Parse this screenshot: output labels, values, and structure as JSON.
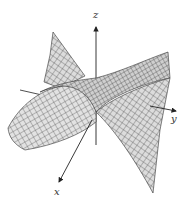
{
  "figure": {
    "surface_fill": "#d9d9d9",
    "mesh_color": "#3a3a3a",
    "axis_color": "#222222"
  },
  "axes": {
    "x_label": "x",
    "y_label": "y",
    "z_label": "z"
  }
}
